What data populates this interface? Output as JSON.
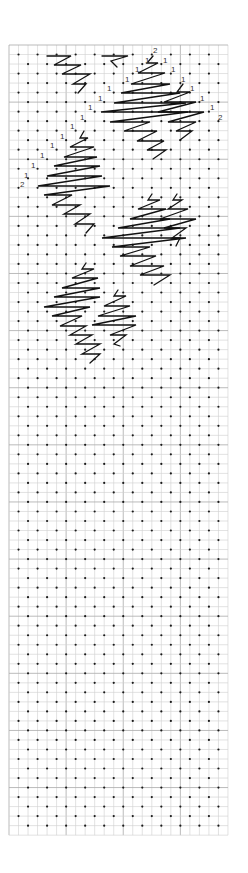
{
  "diagram": {
    "title": "",
    "grid": {
      "x0": 9,
      "y0": 45,
      "cell": 9.52,
      "cols": 23,
      "rows": 83,
      "line_color": "#cfcfcf",
      "major_line_color": "#a9a9a9",
      "dot_color": "#1a1a1a"
    },
    "stitch_color": "#111111",
    "labels": [
      {
        "text": "2",
        "x": 153,
        "y": 53
      },
      {
        "text": "1",
        "x": 145,
        "y": 63
      },
      {
        "text": "1",
        "x": 163,
        "y": 63
      },
      {
        "text": "1",
        "x": 135,
        "y": 72
      },
      {
        "text": "1",
        "x": 171,
        "y": 72
      },
      {
        "text": "1",
        "x": 125,
        "y": 82
      },
      {
        "text": "1",
        "x": 181,
        "y": 82
      },
      {
        "text": "1",
        "x": 107,
        "y": 91
      },
      {
        "text": "1",
        "x": 190,
        "y": 91
      },
      {
        "text": "1",
        "x": 98,
        "y": 101
      },
      {
        "text": "1",
        "x": 200,
        "y": 101
      },
      {
        "text": "1",
        "x": 88,
        "y": 110
      },
      {
        "text": "1",
        "x": 210,
        "y": 110
      },
      {
        "text": "2",
        "x": 218,
        "y": 120
      },
      {
        "text": "1",
        "x": 80,
        "y": 120
      },
      {
        "text": "1",
        "x": 70,
        "y": 129
      },
      {
        "text": "1",
        "x": 60,
        "y": 139
      },
      {
        "text": "1",
        "x": 50,
        "y": 148
      },
      {
        "text": "1",
        "x": 40,
        "y": 158
      },
      {
        "text": "1",
        "x": 31,
        "y": 168
      },
      {
        "text": "2",
        "x": 20,
        "y": 187
      },
      {
        "text": "1",
        "x": 24,
        "y": 178
      }
    ],
    "stitch_paths": [
      "M47,56 L71,56 L54,65 L81,65 L62,74 L90,74 L73,84 L86,84 L78,93",
      "M102,56 L128,56 L111,61 L117,67",
      "M153,56 L147,63 L158,63 L138,73 L165,73 L131,84 L170,84 L121,93 L180,93 L114,103 L186,103 L101,112 L188,112 L110,122 L150,122 L124,131 L157,131 L137,141 L164,141 L147,150 L166,150 L153,159",
      "M183,84 L177,92 L190,92 L164,102 L196,102 L158,112 L204,112 L168,122 L196,122 L176,131 L192,131 L180,140",
      "M84,131 L80,138 L88,138 L70,147 L94,147 L64,157 L97,157 L54,166 L100,166 L47,176 L102,176 L38,186 L110,186 L44,195 L72,195 L52,205 L80,205 L64,214 L90,214 L75,224 L94,224 L86,233",
      "M152,194 L148,200 L160,200 L138,209 L166,209 L130,219 L170,219 L118,228 L180,228 L102,238 L186,238 L112,247 L150,247 L120,256 L156,256 L130,266 L164,266 L140,275 L170,275 L154,285",
      "M86,263 L82,269 L94,269 L72,278 L98,278 L62,288 L100,288 L54,297 L100,297 L44,307 L90,307 L52,316 L82,316 L60,326 L86,326 L70,335 L92,335 L76,344 L100,344 L82,354 L100,354 L90,363",
      "M118,290 L114,296 L126,296 L104,306 L130,306 L98,316 L136,316 L92,325 L136,325 L110,335 L126,335 L114,344 L120,346",
      "M177,194 L173,200 L182,200 L168,209 L188,209 L160,219 L196,219 L164,228 L186,228 L172,238 L180,238 L176,246"
    ]
  }
}
